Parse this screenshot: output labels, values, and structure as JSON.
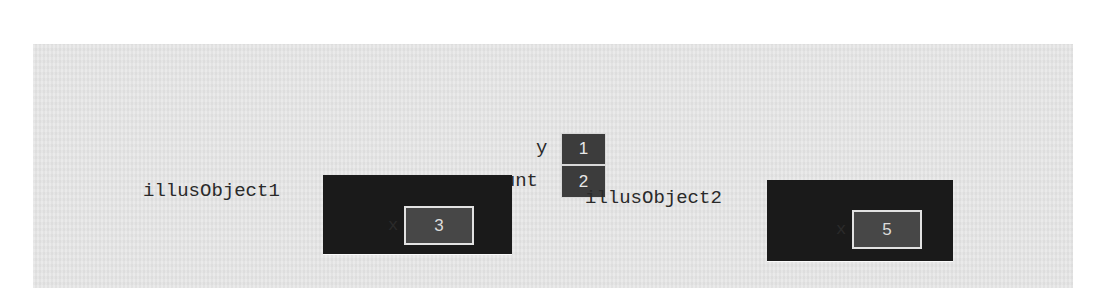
{
  "diagram": {
    "colors": {
      "background": "#e5e5e5",
      "variable_cell": "#3c3c3c",
      "object_box": "#1a1a1a",
      "field_box": "#474747",
      "field_border": "#e2e2e2",
      "label_text": "#2a2a2a"
    },
    "static_variables": [
      {
        "name": "y",
        "value": "1"
      },
      {
        "name": "count",
        "value": "2"
      }
    ],
    "objects": [
      {
        "name": "illusObject1",
        "field": {
          "name": "x",
          "value": "3"
        }
      },
      {
        "name": "illusObject2",
        "field": {
          "name": "x",
          "value": "5"
        }
      }
    ]
  }
}
